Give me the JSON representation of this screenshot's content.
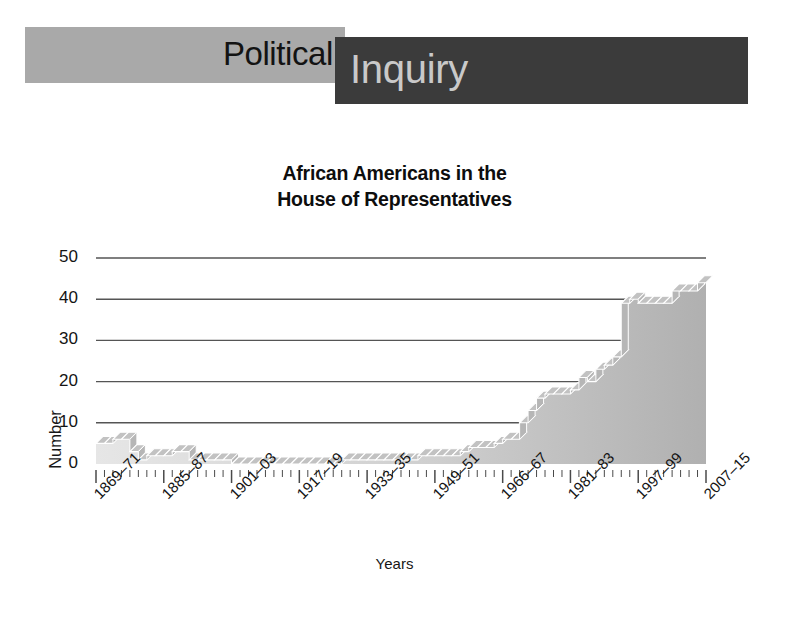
{
  "header": {
    "banner_light_text": "Political",
    "banner_dark_text": "Inquiry",
    "banner_light_color": "#a9a9a9",
    "banner_dark_color": "#3b3b3b",
    "banner_light_text_color": "#131313",
    "banner_dark_text_color": "#c9c9c9"
  },
  "chart_data": {
    "type": "area",
    "title": "African Americans in the House of Representatives",
    "title_line_1": "African Americans in the",
    "title_line_2": "House of Representatives",
    "xlabel": "Years",
    "ylabel": "Number",
    "ylim": [
      0,
      50
    ],
    "yticks": [
      0,
      10,
      20,
      30,
      40,
      50
    ],
    "grid": true,
    "grid_color": "#555555",
    "legend": "none",
    "area_fill_color": "#c8c8c8",
    "area_top_color": "#b4b4b4",
    "style_note": "3-D stepped ribbon area chart, grayscale",
    "xtick_labels": [
      "1869–71",
      "1885–87",
      "1901–03",
      "1917–19",
      "1933–35",
      "1949–51",
      "1966–67",
      "1981–83",
      "1997–99",
      "2007–15"
    ],
    "x": [
      "1869-71",
      "1871-73",
      "1873-75",
      "1875-77",
      "1877-79",
      "1879-81",
      "1881-83",
      "1883-85",
      "1885-87",
      "1887-89",
      "1889-91",
      "1891-93",
      "1893-95",
      "1895-97",
      "1897-99",
      "1899-01",
      "1901-03",
      "1903-05",
      "1905-07",
      "1907-09",
      "1909-11",
      "1911-13",
      "1913-15",
      "1915-17",
      "1917-19",
      "1919-21",
      "1921-23",
      "1923-25",
      "1925-27",
      "1927-29",
      "1929-31",
      "1931-33",
      "1933-35",
      "1935-37",
      "1937-39",
      "1939-41",
      "1941-43",
      "1943-45",
      "1945-47",
      "1947-49",
      "1949-51",
      "1951-53",
      "1953-55",
      "1955-57",
      "1957-59",
      "1959-61",
      "1961-63",
      "1963-65",
      "1965-67",
      "1967-69",
      "1969-71",
      "1971-73",
      "1973-75",
      "1975-77",
      "1977-79",
      "1979-81",
      "1981-83",
      "1983-85",
      "1985-87",
      "1987-89",
      "1989-91",
      "1991-93",
      "1993-95",
      "1995-97",
      "1997-99",
      "1999-01",
      "2001-03",
      "2003-05",
      "2005-07",
      "2007-09",
      "2009-11",
      "2011-13",
      "2013-15"
    ],
    "values": [
      5,
      5,
      6,
      6,
      3,
      1,
      2,
      2,
      2,
      3,
      3,
      1,
      1,
      1,
      1,
      1,
      0,
      0,
      0,
      0,
      0,
      0,
      0,
      0,
      0,
      0,
      0,
      0,
      0,
      1,
      1,
      1,
      1,
      1,
      1,
      1,
      1,
      1,
      2,
      2,
      2,
      2,
      2,
      3,
      4,
      4,
      4,
      5,
      6,
      6,
      10,
      13,
      16,
      17,
      17,
      17,
      18,
      21,
      20,
      23,
      24,
      26,
      39,
      40,
      39,
      39,
      39,
      39,
      42,
      42,
      42,
      44,
      44
    ]
  }
}
